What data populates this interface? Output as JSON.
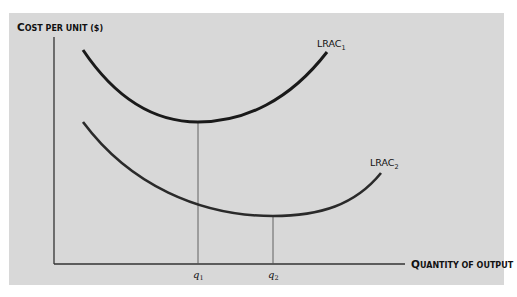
{
  "diagram": {
    "y_axis_label": {
      "initial": "C",
      "rest": "OST PER UNIT ($)"
    },
    "x_axis_label": {
      "initial": "Q",
      "rest": "UANTITY OF OUTPUT"
    },
    "curves": [
      {
        "name": "LRAC",
        "subscript": "1",
        "color": "#1a1a1a"
      },
      {
        "name": "LRAC",
        "subscript": "2",
        "color": "#2a2a2a"
      }
    ],
    "ticks": [
      {
        "label": "q",
        "subscript": "1"
      },
      {
        "label": "q",
        "subscript": "2"
      }
    ],
    "colors": {
      "background": "#d8d8d8",
      "axis": "#333333",
      "curve": "#1a1a1a"
    }
  }
}
